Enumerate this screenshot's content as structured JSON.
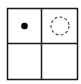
{
  "diagram": {
    "type": "grid",
    "rows": 2,
    "cols": 2,
    "colors": {
      "line": "#1a1a1a",
      "dot": "#000000",
      "dashed_circle": "#555555",
      "background": "#ffffff"
    },
    "cells": [
      {
        "row": 0,
        "col": 0,
        "content": "filled-dot"
      },
      {
        "row": 0,
        "col": 1,
        "content": "dashed-circle"
      },
      {
        "row": 1,
        "col": 0,
        "content": "empty"
      },
      {
        "row": 1,
        "col": 1,
        "content": "empty"
      }
    ]
  }
}
